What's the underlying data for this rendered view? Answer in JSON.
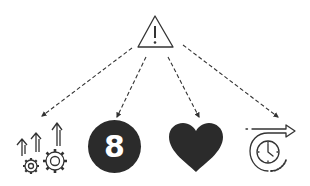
{
  "diagram": {
    "title": "",
    "colors": {
      "stroke": "#333333",
      "fill": "#2b2b2b",
      "background": "#ffffff"
    },
    "root": {
      "icon": "warning-triangle-icon",
      "symbol": "!"
    },
    "branches": [
      {
        "icon": "growth-gears-icon",
        "label": ""
      },
      {
        "icon": "number-eight-circle-icon",
        "label": "8"
      },
      {
        "icon": "heart-icon",
        "label": ""
      },
      {
        "icon": "clock-forward-icon",
        "label": ""
      }
    ],
    "edges": [
      {
        "from": "root",
        "to": "growth-gears-icon",
        "style": "dashed"
      },
      {
        "from": "root",
        "to": "number-eight-circle-icon",
        "style": "dashed"
      },
      {
        "from": "root",
        "to": "heart-icon",
        "style": "dashed"
      },
      {
        "from": "root",
        "to": "clock-forward-icon",
        "style": "dashed"
      }
    ]
  }
}
